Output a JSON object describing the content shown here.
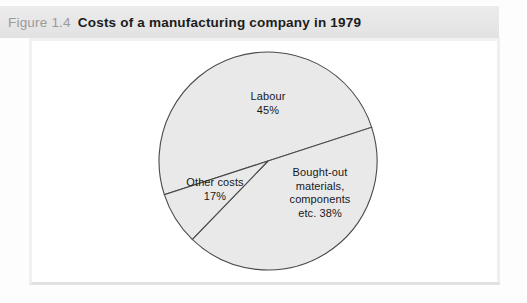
{
  "figure": {
    "number": "Figure 1.4",
    "caption": "Costs of a manufacturing company in 1979"
  },
  "colors": {
    "slice_fill": "#e9e9e9",
    "slice_stroke": "#4a4a4a",
    "title_band_bg": "#e9e9e9",
    "title_number_color": "#9a9a9a",
    "title_caption_color": "#1c1c1c",
    "panel_bg": "#ffffff",
    "panel_border": "#f1f1f1"
  },
  "chart_data": {
    "type": "pie",
    "title": "Costs of a manufacturing company in 1979",
    "subtitle": "",
    "xlabel": "",
    "ylabel": "",
    "grid": false,
    "legend": "none",
    "labels_inside_slices": true,
    "categories": [
      "Labour",
      "Bought-out materials, components etc.",
      "Other costs"
    ],
    "values": [
      45,
      38,
      17
    ],
    "unit": "%",
    "slices": [
      {
        "name": "Labour",
        "value": 45,
        "label_lines": [
          "Labour",
          "45%"
        ],
        "start_angle_deg": 162,
        "end_angle_deg": 342,
        "fill": "#e9e9e9"
      },
      {
        "name": "Bought-out materials, components etc.",
        "value": 38,
        "label_lines": [
          "Bought-out",
          "materials,",
          "components",
          "etc. 38%"
        ],
        "start_angle_deg": 342,
        "end_angle_deg": 494,
        "fill": "#e9e9e9"
      },
      {
        "name": "Other costs",
        "value": 17,
        "label_lines": [
          "Other costs",
          "17%"
        ],
        "start_angle_deg": 494,
        "end_angle_deg": 522,
        "fill": "#e9e9e9"
      }
    ]
  },
  "labels": {
    "labour": {
      "line1": "Labour",
      "line2": "45%"
    },
    "other_costs": {
      "line1": "Other costs",
      "line2": "17%"
    },
    "bought_out": {
      "line1": "Bought-out",
      "line2": "materials,",
      "line3": "components",
      "line4": "etc. 38%"
    }
  }
}
